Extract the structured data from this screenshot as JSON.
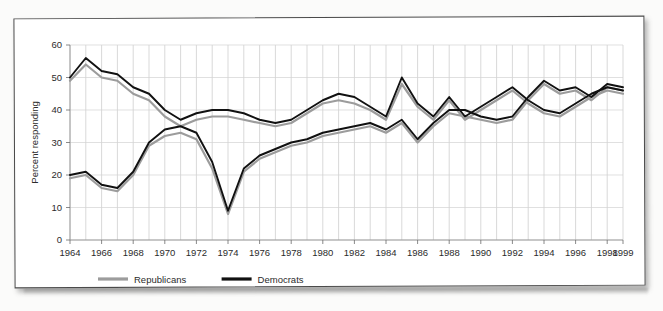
{
  "figure": {
    "y_axis_title": "Percent responding",
    "legend": [
      {
        "key": "republicans",
        "label": "Republicans",
        "color": "#9c9c9c"
      },
      {
        "key": "democrats",
        "label": "Democrats",
        "color": "#111111"
      }
    ]
  },
  "chart_data": {
    "type": "line",
    "title": "",
    "xlabel": "",
    "ylabel": "Percent responding",
    "ylim": [
      0,
      60
    ],
    "xlim": [
      1964,
      1999
    ],
    "yticks": [
      0,
      10,
      20,
      30,
      40,
      50,
      60
    ],
    "xticks": [
      1964,
      1966,
      1968,
      1970,
      1972,
      1974,
      1976,
      1978,
      1980,
      1982,
      1984,
      1986,
      1988,
      1990,
      1992,
      1994,
      1996,
      1998,
      1999
    ],
    "x_tick_labels": [
      "1964",
      "1966",
      "1968",
      "1970",
      "1972",
      "1974",
      "1976",
      "1978",
      "1980",
      "1982",
      "1984",
      "1986",
      "1988",
      "1990",
      "1992",
      "1994",
      "1996",
      "1998",
      "1999"
    ],
    "grid": true,
    "legend_position": "below-axes-left",
    "x": [
      1964,
      1965,
      1966,
      1967,
      1968,
      1969,
      1970,
      1971,
      1972,
      1973,
      1974,
      1975,
      1976,
      1977,
      1978,
      1979,
      1980,
      1981,
      1982,
      1983,
      1984,
      1985,
      1986,
      1987,
      1988,
      1989,
      1990,
      1991,
      1992,
      1993,
      1994,
      1995,
      1996,
      1997,
      1998,
      1999
    ],
    "series": [
      {
        "name": "Democrats, high series",
        "color": "#111111",
        "comment": "upper black trace: starts ~50, peaks ~56 in 1965, falls to ~37 by 1969, plateau ~40, dips ~24 in 1971, rises ~46, then 49 plateau 1975-1977, decline to ~36, rise to ~43, spike 50 in 1984, ~37, 42, peak 52 in 1988, ~38, rising to 49-50 by 1994, ~38 in 1998, 47 in 1999",
        "values": [
          50,
          56,
          52,
          51,
          47,
          45,
          40,
          37,
          39,
          40,
          40,
          39,
          37,
          36,
          37,
          40,
          43,
          45,
          44,
          41,
          38,
          50,
          42,
          38,
          44,
          38,
          41,
          44,
          47,
          43,
          40,
          39,
          42,
          45,
          47,
          46
        ]
      },
      {
        "name": "Republicans, high series",
        "color": "#9c9c9c",
        "comment": "upper gray trace shadowing black upper line, generally 1-3 points lower",
        "values": [
          49,
          54,
          50,
          49,
          45,
          43,
          38,
          35,
          37,
          38,
          38,
          37,
          36,
          35,
          36,
          39,
          42,
          43,
          42,
          40,
          37,
          48,
          41,
          37,
          43,
          37,
          40,
          43,
          46,
          42,
          39,
          38,
          41,
          44,
          46,
          45
        ]
      },
      {
        "name": "Democrats, low series",
        "color": "#111111",
        "comment": "lower black trace: begins ~20-21 in 1964, dips ~16, climbs to ~30 by 1969, slides down, deep V to ~9 at 1974, recovery to ~28 by 1980, plateau 33-37, peaks 45 in 1987-88, 36-40 range through 1990s, converging ~46 in 1999",
        "values": [
          20,
          21,
          17,
          16,
          21,
          30,
          34,
          35,
          33,
          24,
          9,
          22,
          26,
          28,
          30,
          31,
          33,
          34,
          35,
          36,
          34,
          37,
          31,
          36,
          40,
          40,
          38,
          37,
          38,
          44,
          49,
          46,
          47,
          44,
          48,
          47
        ]
      },
      {
        "name": "Republicans, low series",
        "color": "#9c9c9c",
        "comment": "lower gray trace shadowing black lower line",
        "values": [
          19,
          20,
          16,
          15,
          20,
          29,
          32,
          33,
          31,
          22,
          8,
          21,
          25,
          27,
          29,
          30,
          32,
          33,
          34,
          35,
          33,
          36,
          30,
          35,
          39,
          38,
          37,
          36,
          37,
          43,
          48,
          45,
          46,
          43,
          47,
          46
        ]
      }
    ]
  }
}
